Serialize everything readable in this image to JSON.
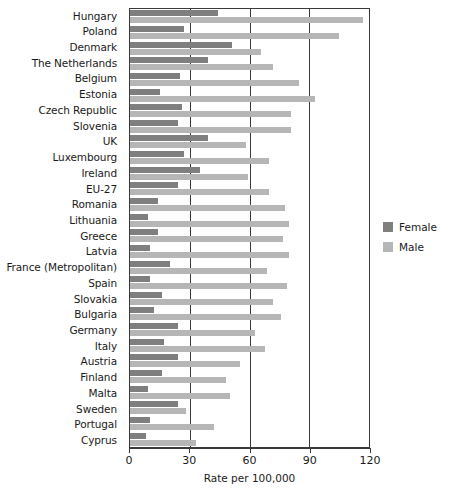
{
  "chart_data": {
    "type": "bar",
    "orientation": "horizontal",
    "title": "",
    "xlabel": "Rate per 100,000",
    "ylabel": "",
    "xlim": [
      0,
      120
    ],
    "xticks": [
      0,
      30,
      60,
      90,
      120
    ],
    "xtick_labels": [
      "0",
      "30",
      "60",
      "90",
      "120"
    ],
    "grid": true,
    "legend_position": "right",
    "categories": [
      "Hungary",
      "Poland",
      "Denmark",
      "The Netherlands",
      "Belgium",
      "Estonia",
      "Czech Republic",
      "Slovenia",
      "UK",
      "Luxembourg",
      "Ireland",
      "EU-27",
      "Romania",
      "Lithuania",
      "Greece",
      "Latvia",
      "France (Metropolitan)",
      "Spain",
      "Slovakia",
      "Bulgaria",
      "Germany",
      "Italy",
      "Austria",
      "Finland",
      "Malta",
      "Sweden",
      "Portugal",
      "Cyprus"
    ],
    "series": [
      {
        "name": "Female",
        "color": "#7f7f7f",
        "values": [
          44,
          27,
          51,
          39,
          25,
          15,
          26,
          24,
          39,
          27,
          35,
          24,
          14,
          9,
          14,
          10,
          20,
          10,
          16,
          12,
          24,
          17,
          24,
          16,
          9,
          24,
          10,
          8
        ]
      },
      {
        "name": "Male",
        "color": "#b6b6b6",
        "values": [
          117,
          105,
          66,
          72,
          85,
          93,
          81,
          81,
          58,
          70,
          59,
          70,
          78,
          80,
          77,
          80,
          69,
          79,
          72,
          76,
          63,
          68,
          55,
          48,
          50,
          28,
          42,
          33
        ]
      }
    ]
  },
  "legend": {
    "items": [
      {
        "label": "Female",
        "color": "#7f7f7f"
      },
      {
        "label": "Male",
        "color": "#b6b6b6"
      }
    ]
  }
}
